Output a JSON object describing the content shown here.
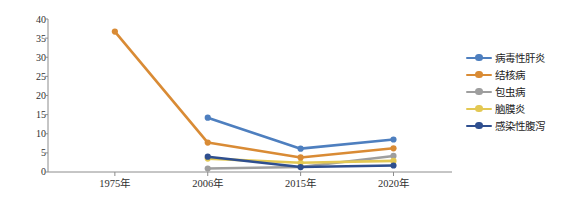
{
  "chart_data": {
    "type": "line",
    "title": "",
    "xlabel": "",
    "ylabel": "死亡率（1/10万）",
    "categories": [
      "1975年",
      "2006年",
      "2015年",
      "2020年"
    ],
    "ylim": [
      0,
      40
    ],
    "ytick_labels": [
      "0",
      "5",
      "10",
      "15",
      "20",
      "25",
      "30",
      "35",
      "40"
    ],
    "ytick_values": [
      0,
      5,
      10,
      15,
      20,
      25,
      30,
      35,
      40
    ],
    "grid": false,
    "legend_position": "right",
    "series": [
      {
        "name": "病毒性肝炎",
        "color": "#4E7FBF",
        "values": [
          null,
          14.2,
          6.1,
          8.5
        ]
      },
      {
        "name": "结核病",
        "color": "#D98B35",
        "values": [
          36.7,
          7.7,
          3.8,
          6.2
        ]
      },
      {
        "name": "包虫病",
        "color": "#9E9E9E",
        "values": [
          null,
          0.9,
          1.3,
          4.2
        ]
      },
      {
        "name": "脑膜炎",
        "color": "#E3C853",
        "values": [
          null,
          3.5,
          2.4,
          2.9
        ]
      },
      {
        "name": "感染性腹泻",
        "color": "#2F4F8F",
        "values": [
          null,
          4.0,
          1.3,
          1.7
        ]
      }
    ]
  },
  "axis": {
    "ylabel": "死亡率（1/10万）",
    "yticks": [
      "40",
      "35",
      "30",
      "25",
      "20",
      "15",
      "10",
      "5",
      "0"
    ],
    "xticks": [
      "1975年",
      "2006年",
      "2015年",
      "2020年"
    ]
  },
  "legend": {
    "items": [
      {
        "label": "病毒性肝炎",
        "color": "#4E7FBF"
      },
      {
        "label": "结核病",
        "color": "#D98B35"
      },
      {
        "label": "包虫病",
        "color": "#9E9E9E"
      },
      {
        "label": "脑膜炎",
        "color": "#E3C853"
      },
      {
        "label": "感染性腹泻",
        "color": "#2F4F8F"
      }
    ]
  },
  "colors": {
    "axis_line": "#8c8c8c",
    "tick_text": "#2f2f2f",
    "background": "#ffffff"
  }
}
